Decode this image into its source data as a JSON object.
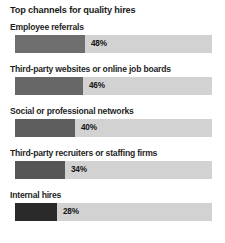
{
  "chart_data": {
    "type": "bar",
    "title": "Top channels for quality hires",
    "xlabel": "",
    "ylabel": "",
    "orientation": "horizontal",
    "grid": false,
    "legend": null,
    "xlim": [
      0,
      100
    ],
    "categories": [
      "Employee referrals",
      "Third-party websites or online job boards",
      "Social or professional networks",
      "Third-party recruiters or staffing firms",
      "Internal hires"
    ],
    "values": [
      48,
      46,
      40,
      34,
      28
    ],
    "value_labels": [
      "48%",
      "46%",
      "40%",
      "34%",
      "28%"
    ],
    "bar_colors": [
      "#6e6e6e",
      "#676767",
      "#5e5e5e",
      "#565656",
      "#2a2a2a"
    ],
    "track_color": "#d2d2d2",
    "fill_px": [
      70,
      68,
      60,
      50,
      42
    ]
  },
  "chart": {
    "title": "Top channels for quality hires",
    "bars": [
      {
        "label": "Employee referrals",
        "value_label": "48%",
        "fill_px": 70,
        "color": "#6e6e6e",
        "top": 22
      },
      {
        "label": "Third-party websites or online job boards",
        "value_label": "46%",
        "fill_px": 68,
        "color": "#676767",
        "top": 64
      },
      {
        "label": "Social or professional networks",
        "value_label": "40%",
        "fill_px": 60,
        "color": "#5e5e5e",
        "top": 106
      },
      {
        "label": "Third-party recruiters or staffing firms",
        "value_label": "34%",
        "fill_px": 50,
        "color": "#565656",
        "top": 148
      },
      {
        "label": "Internal hires",
        "value_label": "28%",
        "fill_px": 42,
        "color": "#2a2a2a",
        "top": 190
      }
    ]
  }
}
